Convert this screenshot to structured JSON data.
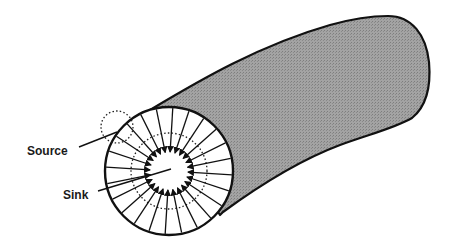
{
  "diagram": {
    "labels": {
      "source": "Source",
      "sink": "Sink"
    },
    "colors": {
      "tube_fill": "#9a9a9a",
      "outline": "#111111",
      "face_fill": "#ffffff"
    },
    "arrow_count": 24
  }
}
